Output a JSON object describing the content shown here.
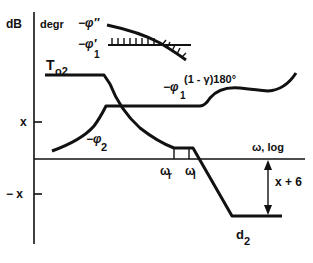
{
  "axes": {
    "y_label_left": "dB",
    "y_label_right": "degr",
    "x_label": "ω, log",
    "y_tick_pos": "x",
    "y_tick_neg": "− x"
  },
  "labels": {
    "phi_double_prime": "−φ″",
    "phi1_prime": "−φ′",
    "phi1_prime_sub": "1",
    "T_o2": "T",
    "T_o2_sub": "o2",
    "phi1": "−φ",
    "phi1_sub": "1",
    "phi1_sup": "(1 - γ)180°",
    "phi2": "−φ",
    "phi2_sub": "2",
    "omega_r": "ω",
    "omega_r_sub": "r",
    "omega_l": "ω",
    "omega_l_sub": "l",
    "gap": "x + 6",
    "d2": "d",
    "d2_sub": "2"
  }
}
